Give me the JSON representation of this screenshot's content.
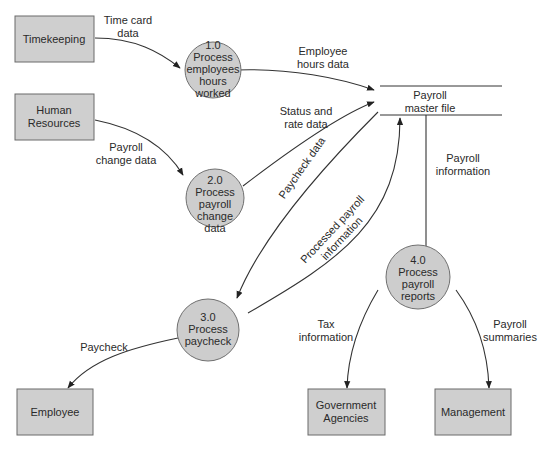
{
  "diagram": {
    "type": "data-flow-diagram",
    "external_entities": [
      {
        "id": "timekeeping",
        "label": "Timekeeping"
      },
      {
        "id": "human_resources",
        "label_lines": [
          "Human",
          "Resources"
        ]
      },
      {
        "id": "employee",
        "label": "Employee"
      },
      {
        "id": "government_agencies",
        "label_lines": [
          "Government",
          "Agencies"
        ]
      },
      {
        "id": "management",
        "label": "Management"
      }
    ],
    "processes": [
      {
        "id": "p1",
        "number": "1.0",
        "label_lines": [
          "Process",
          "employees",
          "hours",
          "worked"
        ]
      },
      {
        "id": "p2",
        "number": "2.0",
        "label_lines": [
          "Process",
          "payroll",
          "change",
          "data"
        ]
      },
      {
        "id": "p3",
        "number": "3.0",
        "label_lines": [
          "Process",
          "paycheck"
        ]
      },
      {
        "id": "p4",
        "number": "4.0",
        "label_lines": [
          "Process",
          "payroll",
          "reports"
        ]
      }
    ],
    "data_stores": [
      {
        "id": "payroll_master",
        "label_lines": [
          "Payroll",
          "master file"
        ]
      }
    ],
    "flows": [
      {
        "from": "timekeeping",
        "to": "p1",
        "label_lines": [
          "Time card",
          "data"
        ]
      },
      {
        "from": "p1",
        "to": "payroll_master",
        "label_lines": [
          "Employee",
          "hours data"
        ]
      },
      {
        "from": "human_resources",
        "to": "p2",
        "label_lines": [
          "Payroll",
          "change data"
        ]
      },
      {
        "from": "p2",
        "to": "payroll_master",
        "label_lines": [
          "Status and",
          "rate data"
        ]
      },
      {
        "from": "payroll_master",
        "to": "p3",
        "label": "Paycheck data"
      },
      {
        "from": "p3",
        "to": "payroll_master",
        "label_lines": [
          "Processed payroll",
          "information"
        ]
      },
      {
        "from": "payroll_master",
        "to": "p4",
        "label_lines": [
          "Payroll",
          "information"
        ]
      },
      {
        "from": "p3",
        "to": "employee",
        "label": "Paycheck"
      },
      {
        "from": "p4",
        "to": "government_agencies",
        "label_lines": [
          "Tax",
          "information"
        ]
      },
      {
        "from": "p4",
        "to": "management",
        "label_lines": [
          "Payroll",
          "summaries"
        ]
      }
    ]
  }
}
